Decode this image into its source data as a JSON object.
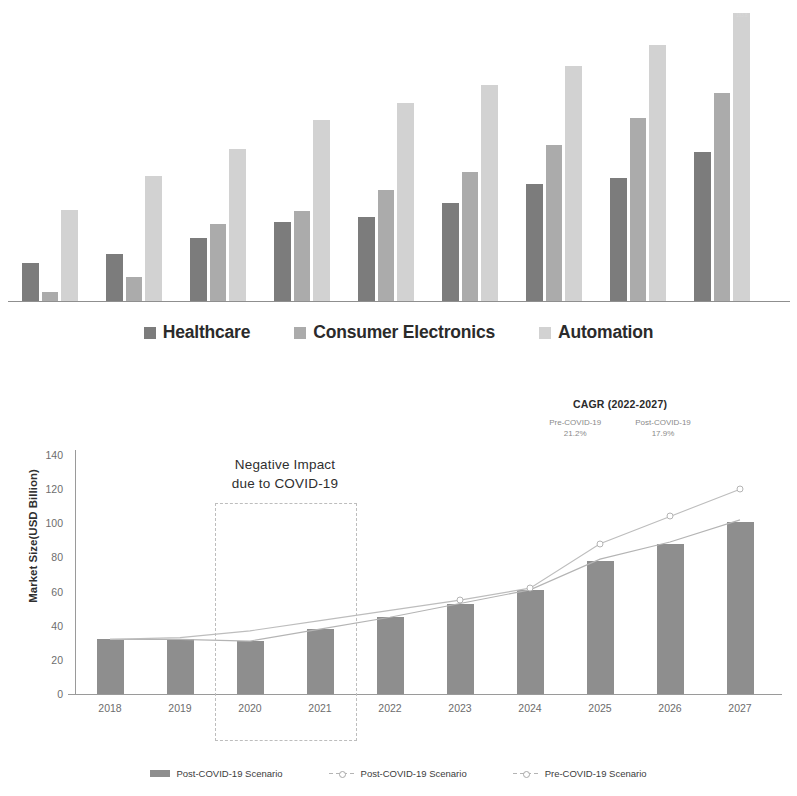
{
  "chart_data": [
    {
      "type": "bar",
      "title": "",
      "xlabel": "",
      "ylabel": "",
      "grid": false,
      "legend_position": "bottom",
      "categories": [
        "G1",
        "G2",
        "G3",
        "G4",
        "G5",
        "G6",
        "G7",
        "G8",
        "G9"
      ],
      "series": [
        {
          "name": "Healthcare",
          "color": "#7c7c7c",
          "values": [
            18.5,
            22.5,
            30.5,
            38.0,
            40.5,
            47.5,
            56.5,
            59.5,
            72.0
          ]
        },
        {
          "name": "Consumer Electronics",
          "color": "#ababab",
          "values": [
            4.5,
            11.5,
            37.0,
            43.5,
            53.5,
            62.5,
            75.5,
            88.5,
            100.5
          ]
        },
        {
          "name": "Automation",
          "color": "#d2d2d2",
          "values": [
            44.0,
            60.5,
            73.5,
            87.5,
            95.5,
            104.5,
            113.5,
            123.5,
            139.0
          ]
        }
      ],
      "bar_labels": {
        "series": "Automation",
        "category": "G9",
        "text": "163.8"
      }
    },
    {
      "type": "bar+line",
      "title": "",
      "xlabel": "",
      "ylabel": "Market Size(USD Billion)",
      "grid": false,
      "legend_position": "bottom",
      "ylim": [
        0,
        140
      ],
      "yticks": [
        0,
        20,
        40,
        60,
        80,
        100,
        120,
        140
      ],
      "categories": [
        "2018",
        "2019",
        "2020",
        "2021",
        "2022",
        "2023",
        "2024",
        "2025",
        "2026",
        "2027"
      ],
      "series": [
        {
          "name": "Post-COVID-19 Scenario",
          "render": "bar",
          "color": "#8e8e8e",
          "values": [
            32,
            32,
            31,
            38,
            45,
            53,
            61,
            78,
            88,
            101
          ]
        },
        {
          "name": "Post-COVID-19 Scenario",
          "render": "line",
          "color": "#b4b4b4",
          "values": [
            32,
            32,
            31,
            38,
            45,
            53,
            61,
            79,
            89,
            102
          ]
        },
        {
          "name": "Pre-COVID-19 Scenario",
          "render": "line",
          "color": "#bdbdbd",
          "values": [
            32,
            33,
            37,
            43,
            49,
            55,
            62,
            88,
            104,
            120
          ]
        }
      ],
      "annotations": [
        {
          "name": "covid-impact-callout",
          "text_line1": "Negative Impact",
          "text_line2": "due to COVID-19",
          "span": [
            "2020",
            "2021"
          ]
        },
        {
          "name": "cagr-block",
          "title": "CAGR (2022-2027)",
          "items": [
            {
              "label": "Pre-COVID-19",
              "value": "21.2%"
            },
            {
              "label": "Post-COVID-19",
              "value": "17.9%"
            }
          ]
        }
      ]
    }
  ],
  "top": {
    "legend": [
      {
        "label": "Healthcare",
        "color": "#7c7c7c"
      },
      {
        "label": "Consumer Electronics",
        "color": "#ababab"
      },
      {
        "label": "Automation",
        "color": "#d2d2d2"
      }
    ],
    "top_bar_label": "163.8"
  },
  "bottom": {
    "ylabel": "Market Size(USD Billion)",
    "yticks": [
      "140",
      "120",
      "100",
      "80",
      "60",
      "40",
      "20",
      "0"
    ],
    "xticks": [
      "2018",
      "2019",
      "2020",
      "2021",
      "2022",
      "2023",
      "2024",
      "2025",
      "2026",
      "2027"
    ],
    "callout": {
      "line1": "Negative Impact",
      "line2": "due to COVID-19"
    },
    "cagr": {
      "title": "CAGR (2022-2027)",
      "pre_label": "Pre-COVID-19",
      "pre_value": "21.2%",
      "post_label": "Post-COVID-19",
      "post_value": "17.9%"
    },
    "legend": [
      {
        "label": "Post-COVID-19 Scenario",
        "marker": "bar"
      },
      {
        "label": "Post-COVID-19 Scenario",
        "marker": "line"
      },
      {
        "label": "Pre-COVID-19 Scenario",
        "marker": "line"
      }
    ]
  }
}
